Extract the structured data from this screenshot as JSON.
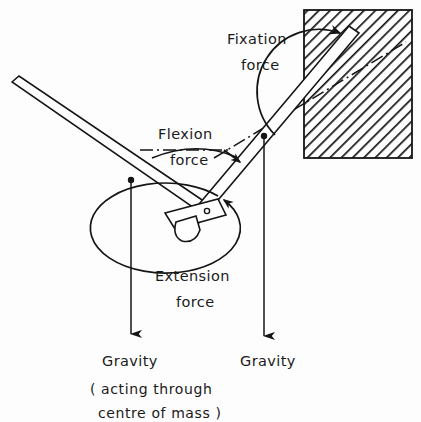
{
  "figure": {
    "background_color": "#fdfdfd",
    "ink_color": "#151515",
    "width": 421,
    "height": 422
  },
  "labels": {
    "fixation_force_line1": "Fixation",
    "fixation_force_line2": "force",
    "flexion_force_line1": "Flexion",
    "flexion_force_line2": "force",
    "extension_force_line1": "Extension",
    "extension_force_line2": "force",
    "gravity_left": "Gravity",
    "gravity_left_note_line1": "( acting  through",
    "gravity_left_note_line2": "centre  of  mass )",
    "gravity_right": "Gravity"
  },
  "elements": {
    "wall": {
      "name": "hatched-wall-block",
      "x": 304,
      "y": 10,
      "width": 108,
      "height": 148,
      "hatch_angle_deg": 45
    },
    "upper_limb": {
      "name": "upper-limb-segment",
      "from_x": 14,
      "from_y": 90,
      "to_x": 205,
      "to_y": 216,
      "thickness": 13
    },
    "lower_limb": {
      "name": "forearm-segment",
      "from_x": 203,
      "from_y": 222,
      "to_x": 356,
      "to_y": 36,
      "thickness": 14
    },
    "joint": {
      "name": "hinge-joint",
      "pivot_x": 207,
      "pivot_y": 212
    },
    "gravity_arrow_left": {
      "name": "gravity-vector-left",
      "origin_x": 131,
      "origin_y": 180,
      "tip_y": 334
    },
    "gravity_arrow_right": {
      "name": "gravity-vector-right",
      "origin_x": 264,
      "origin_y": 136,
      "tip_y": 336
    },
    "centreline": {
      "name": "dash-dot-centreline",
      "from_x": 74,
      "from_y": 116,
      "to_x": 406,
      "to_y": 40
    }
  }
}
